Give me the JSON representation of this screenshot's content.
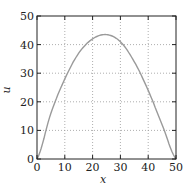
{
  "chart_data": {
    "type": "line",
    "title": "",
    "xlabel": "x",
    "ylabel": "u",
    "xlim": [
      0,
      50
    ],
    "ylim": [
      0,
      50
    ],
    "xticks": [
      "0",
      "10",
      "20",
      "30",
      "40",
      "50"
    ],
    "yticks": [
      "0",
      "10",
      "20",
      "30",
      "40",
      "50"
    ],
    "grid": true,
    "grid_style": "dotted",
    "legend": null,
    "series": [
      {
        "name": "u(x)",
        "color": "#9a9a9a",
        "x": [
          0,
          5,
          10,
          15,
          20,
          25,
          30,
          35,
          40,
          45,
          50
        ],
        "y": [
          0,
          16,
          28,
          37,
          42,
          43.5,
          41,
          34,
          24,
          12,
          0
        ]
      }
    ]
  }
}
